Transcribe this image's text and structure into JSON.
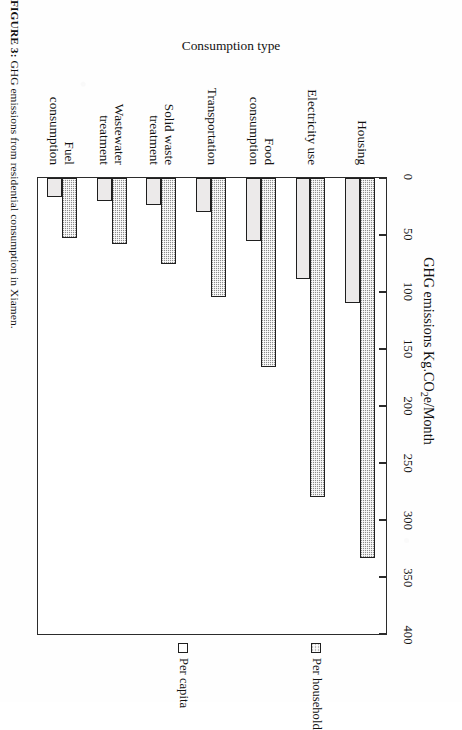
{
  "figure": {
    "caption_label": "FIGURE 3:",
    "caption_text": " GHG emissions from residential consumption in Xiamen.",
    "rotation_note": "90"
  },
  "chart_data": {
    "type": "bar",
    "orientation": "horizontal",
    "title": "",
    "xlabel": "GHG emissions Kg.CO2e/Month",
    "xlabel_rich_prefix": "GHG emissions Kg.CO",
    "xlabel_rich_sub": "2",
    "xlabel_rich_suffix": "e/Month",
    "ylabel": "Consumption type",
    "categories": [
      "Housing",
      "Electricity use",
      "Food consumption",
      "Transportation",
      "Solid waste treatment",
      "Wastewater treatment",
      "Fuel consumption"
    ],
    "category_lines": [
      [
        "Housing"
      ],
      [
        "Electricity use"
      ],
      [
        "Food",
        "consumption"
      ],
      [
        "Transportation"
      ],
      [
        "Solid waste",
        "treatment"
      ],
      [
        "Wastewater",
        "treatment"
      ],
      [
        "Fuel",
        "consumption"
      ]
    ],
    "series": [
      {
        "name": "Per household",
        "values": [
          333,
          280,
          166,
          104,
          75,
          58,
          53
        ],
        "fill": "checkered-dark",
        "color": "#8d8d8d"
      },
      {
        "name": "Per capita",
        "values": [
          110,
          89,
          55,
          30,
          24,
          20,
          17
        ],
        "fill": "solid-light",
        "color": "#eceaea"
      }
    ],
    "xlim": [
      0,
      400
    ],
    "xticks": [
      0,
      50,
      100,
      150,
      200,
      250,
      300,
      350,
      400
    ],
    "xtick_labels": [
      "0",
      "50",
      "100",
      "150",
      "200",
      "250",
      "300",
      "350",
      "400"
    ],
    "grid": false,
    "legend_position": "right",
    "legend_entries": [
      "Per household",
      "Per capita"
    ]
  },
  "colors": {
    "axis": "#2b2b2b",
    "bar_border": "#1f1f1f",
    "text": "#121212",
    "paper": "#ffffff"
  }
}
